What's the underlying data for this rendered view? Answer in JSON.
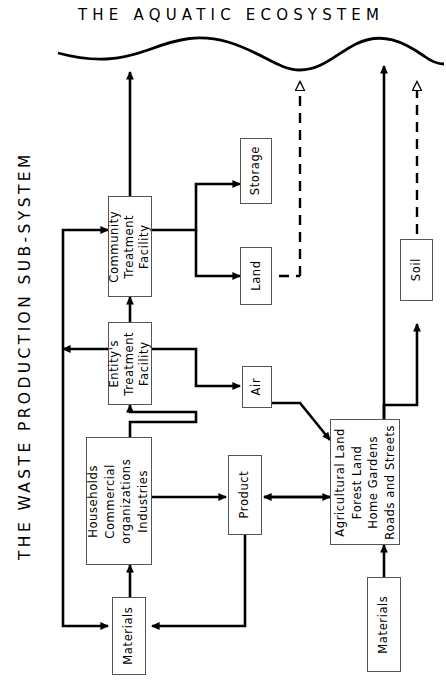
{
  "title": "THE AQUATIC ECOSYSTEM",
  "side_title": "THE WASTE PRODUCTION SUB-SYSTEM",
  "colors": {
    "ink": "#000000",
    "box_stroke": "#555555",
    "background": "#ffffff"
  },
  "boxes": {
    "community_treatment": "Community\nTreatment\nFacility",
    "entity_treatment": "Entity's\nTreatment\nFacility",
    "households": "Households\nCommercial\norganizations\nIndustries",
    "materials_left": "Materials",
    "materials_right": "Materials",
    "product": "Product",
    "storage": "Storage",
    "land": "Land",
    "air": "Air",
    "soil": "Soil",
    "land_uses": "Agricultural Land\nForest Land\nHome Gardens\nRoads and Streets"
  },
  "legend": {
    "solid_arrow": "solid-arrow-flow",
    "dashed_arrow": "dashed-arrow-flow",
    "water_surface": "aquatic-ecosystem-wave"
  }
}
